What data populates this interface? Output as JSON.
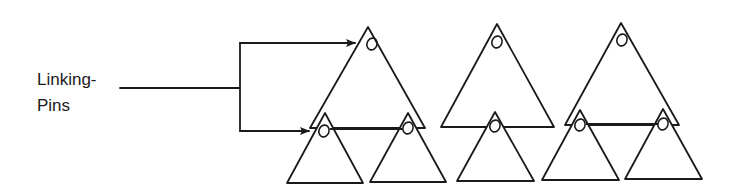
{
  "label": {
    "line1": "Linking-",
    "line2": "Pins"
  },
  "colors": {
    "stroke": "#1a1a1a",
    "background": "#ffffff"
  },
  "structure": {
    "superior_triangles": [
      {
        "apex": [
          368,
          27
        ],
        "left": [
          310,
          128
        ],
        "right": [
          425,
          128
        ],
        "pin": [
          372,
          44
        ]
      },
      {
        "apex": [
          497,
          24
        ],
        "left": [
          441,
          127
        ],
        "right": [
          554,
          127
        ],
        "pin": [
          497,
          42
        ]
      },
      {
        "apex": [
          621,
          23
        ],
        "left": [
          565,
          125
        ],
        "right": [
          679,
          125
        ],
        "pin": [
          622,
          40
        ]
      }
    ],
    "subordinate_triangles": [
      {
        "apex": [
          325,
          113
        ],
        "left": [
          287,
          183
        ],
        "right": [
          363,
          183
        ],
        "pin": [
          324,
          131
        ]
      },
      {
        "apex": [
          408,
          113
        ],
        "left": [
          370,
          182
        ],
        "right": [
          446,
          182
        ],
        "pin": [
          408,
          128
        ]
      },
      {
        "apex": [
          495,
          112
        ],
        "left": [
          457,
          181
        ],
        "right": [
          534,
          181
        ],
        "pin": [
          495,
          126
        ]
      },
      {
        "apex": [
          580,
          110
        ],
        "left": [
          542,
          180
        ],
        "right": [
          619,
          180
        ],
        "pin": [
          580,
          125
        ]
      },
      {
        "apex": [
          663,
          109
        ],
        "left": [
          625,
          179
        ],
        "right": [
          702,
          179
        ],
        "pin": [
          663,
          124
        ]
      }
    ]
  }
}
